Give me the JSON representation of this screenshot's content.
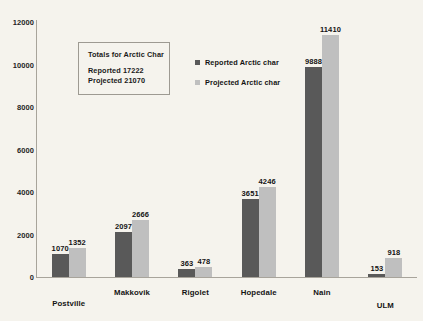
{
  "chart_data": {
    "type": "bar",
    "title": "",
    "xlabel": "",
    "ylabel": "",
    "ylim": [
      0,
      12000
    ],
    "yticks": [
      0,
      2000,
      4000,
      6000,
      8000,
      10000,
      12000
    ],
    "ytick_labels": [
      "0",
      "2000",
      "4000",
      "6000",
      "8000",
      "10000",
      "12000"
    ],
    "grid": false,
    "legend_position": "inside-upper-center",
    "categories": [
      "Postville",
      "Makkovik",
      "Rigolet",
      "Hopedale",
      "Nain",
      "ULM"
    ],
    "series": [
      {
        "name": "Reported Arctic char",
        "color": "#595959",
        "values": [
          1070,
          2097,
          363,
          3651,
          9888,
          153
        ],
        "value_labels": [
          "1070",
          "2097",
          "363",
          "3651",
          "9888",
          "153"
        ]
      },
      {
        "name": "Projected Arctic char",
        "color": "#bfbfbf",
        "values": [
          1352,
          2666,
          478,
          4246,
          11410,
          918
        ],
        "value_labels": [
          "1352",
          "2666",
          "478",
          "4246",
          "11410",
          "918"
        ]
      }
    ],
    "annotations": {
      "totals_box": {
        "title": "Totals for Arctic Char",
        "lines": [
          "Reported 17222",
          "Projected 21070"
        ]
      }
    }
  },
  "colors": {
    "background": "#f5f3ed",
    "reported": "#595959",
    "projected": "#bfbfbf",
    "axis": "#a8a49b",
    "text": "#141414"
  }
}
